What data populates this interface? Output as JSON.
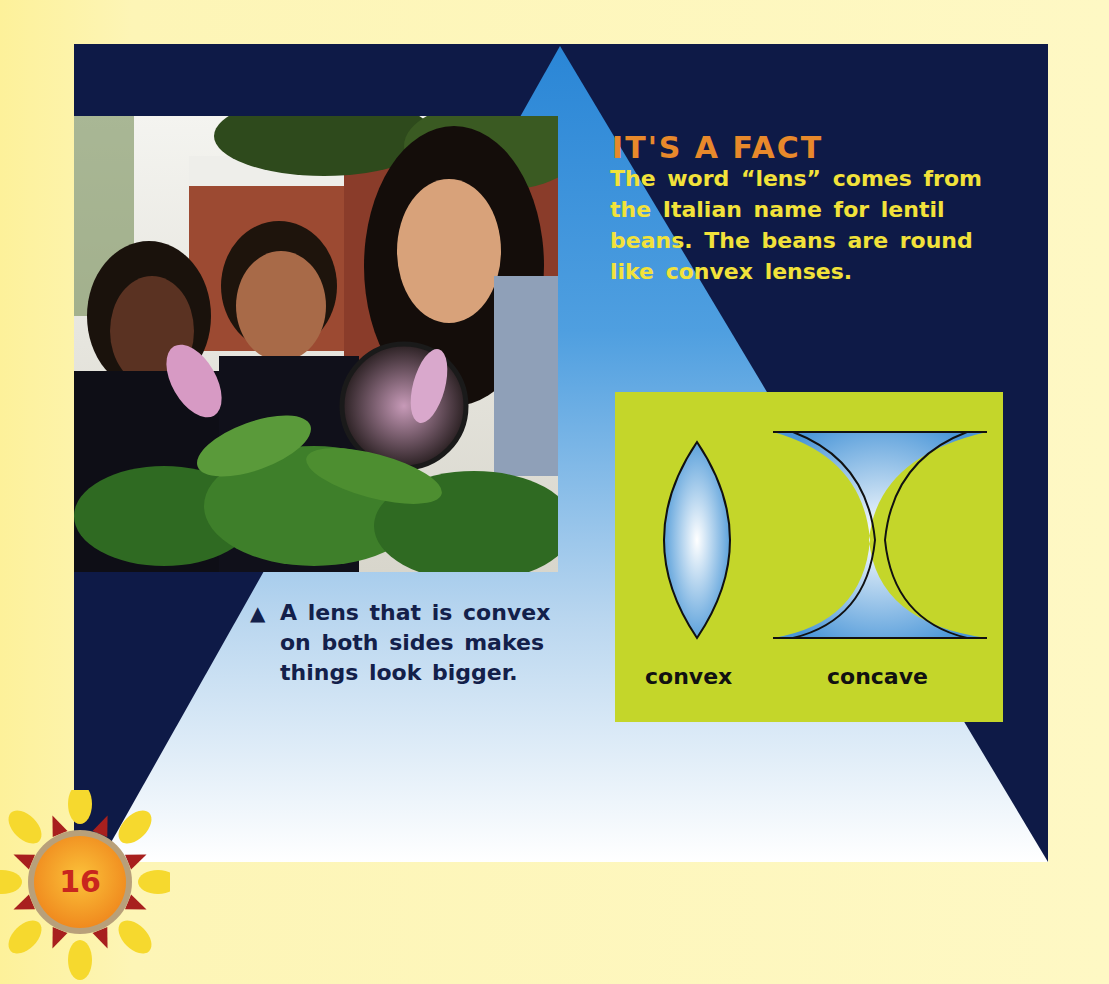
{
  "page": {
    "page_number": "16",
    "colors": {
      "background": "#fdf5b6",
      "panel_navy": "#0e1a47",
      "triangle_top": "#2a86d6",
      "triangle_bottom": "#ffffff",
      "fact_title": "#e8892b",
      "fact_body": "#f2e23a",
      "lens_box": "#c4d62a",
      "caption": "#13204a"
    }
  },
  "photo": {
    "description": "Teacher and two children looking at flowers through a magnifying glass"
  },
  "fact": {
    "title": "IT'S A FACT",
    "body": "The word “lens” comes from the Italian name for lentil beans. The beans are round like convex lenses."
  },
  "caption": {
    "marker": "▲",
    "text": "A lens that is convex on both sides makes things look bigger."
  },
  "diagram": {
    "lenses": [
      {
        "label": "convex"
      },
      {
        "label": "concave"
      }
    ]
  }
}
